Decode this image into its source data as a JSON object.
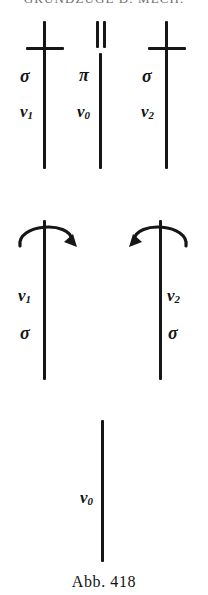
{
  "page": {
    "running_head": "GRUNDZÜGE D. MECH.",
    "caption": "Abb. 418",
    "ink_color": "#161616",
    "background_color": "#ffffff"
  },
  "diagram": {
    "title": "Abb. 418",
    "top_row": [
      {
        "id": "col-1",
        "symbol": "perpendicular",
        "symbol_glyph": "⊥",
        "labels": [
          {
            "name": "sigma",
            "text": "σ",
            "side": "left"
          },
          {
            "name": "v1",
            "text": "v",
            "sub": "1",
            "side": "left"
          }
        ]
      },
      {
        "id": "col-2",
        "symbol": "parallel",
        "symbol_glyph": "∥",
        "labels": [
          {
            "name": "pi",
            "text": "π",
            "side": "left"
          },
          {
            "name": "v0",
            "text": "v",
            "sub": "0",
            "side": "left"
          }
        ]
      },
      {
        "id": "col-3",
        "symbol": "perpendicular",
        "symbol_glyph": "⊥",
        "labels": [
          {
            "name": "sigma",
            "text": "σ",
            "side": "left"
          },
          {
            "name": "v2",
            "text": "v",
            "sub": "2",
            "side": "left"
          }
        ]
      }
    ],
    "middle_row": [
      {
        "id": "col-left",
        "symbol": "rotation-arrow-clockwise",
        "labels": [
          {
            "name": "v1",
            "text": "v",
            "sub": "1",
            "side": "left"
          },
          {
            "name": "sigma",
            "text": "σ",
            "side": "left"
          }
        ]
      },
      {
        "id": "col-right",
        "symbol": "rotation-arrow-counterclockwise",
        "labels": [
          {
            "name": "v2",
            "text": "v",
            "sub": "2",
            "side": "right"
          },
          {
            "name": "sigma",
            "text": "σ",
            "side": "right"
          }
        ]
      }
    ],
    "bottom_row": [
      {
        "id": "col-center",
        "symbol": "none",
        "labels": [
          {
            "name": "v0",
            "text": "v",
            "sub": "0",
            "side": "left"
          }
        ]
      }
    ]
  }
}
